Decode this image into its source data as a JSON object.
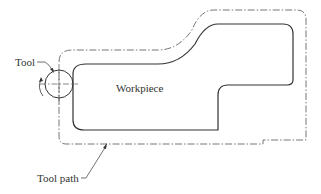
{
  "diagram": {
    "type": "machining-contour",
    "labels": {
      "tool": "Tool",
      "workpiece": "Workpiece",
      "tool_path": "Tool path"
    },
    "colors": {
      "workpiece_outline": "#333333",
      "tool_path_line": "#555555",
      "background": "#ffffff"
    },
    "line_styles": {
      "workpiece": "solid",
      "tool_path": "dash-dot",
      "tool_centerlines": "dash-dot"
    },
    "icons": [
      "rotation-arrow-icon",
      "leader-arrow-icon"
    ]
  }
}
